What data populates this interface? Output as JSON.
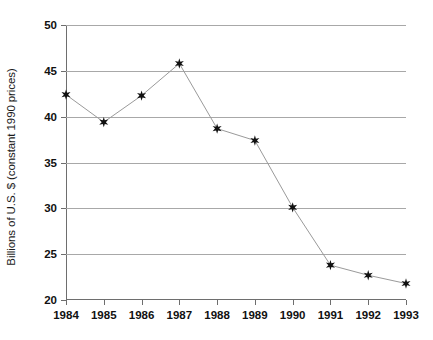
{
  "chart_data": {
    "type": "line",
    "title": "",
    "xlabel": "",
    "ylabel": "Billions of U.S. $ (constant 1990 prices)",
    "categories": [
      "1984",
      "1985",
      "1986",
      "1987",
      "1988",
      "1989",
      "1990",
      "1991",
      "1992",
      "1993"
    ],
    "values": [
      42.4,
      39.4,
      42.3,
      45.8,
      38.7,
      37.4,
      30.1,
      23.8,
      22.7,
      21.8
    ],
    "xlim": [
      1984,
      1993
    ],
    "ylim": [
      20,
      50
    ],
    "yticks": [
      20,
      25,
      30,
      35,
      40,
      45,
      50
    ],
    "ytick_labels": [
      "20",
      "25",
      "30",
      "35",
      "40",
      "45",
      "50"
    ],
    "xticks": [
      1984,
      1985,
      1986,
      1987,
      1988,
      1989,
      1990,
      1991,
      1992,
      1993
    ],
    "xtick_labels": [
      "1984",
      "1985",
      "1986",
      "1987",
      "1988",
      "1989",
      "1990",
      "1991",
      "1992",
      "1993"
    ],
    "grid": true,
    "grid_axis": "y",
    "legend": false,
    "marker": "star",
    "series": [
      {
        "name": "",
        "values": [
          42.4,
          39.4,
          42.3,
          45.8,
          38.7,
          37.4,
          30.1,
          23.8,
          22.7,
          21.8
        ]
      }
    ],
    "colors": {
      "line": "#9a9a9a",
      "marker": "#111111",
      "grid": "#a8a8a8",
      "axis": "#6e6e6e",
      "background": "#ffffff"
    }
  }
}
